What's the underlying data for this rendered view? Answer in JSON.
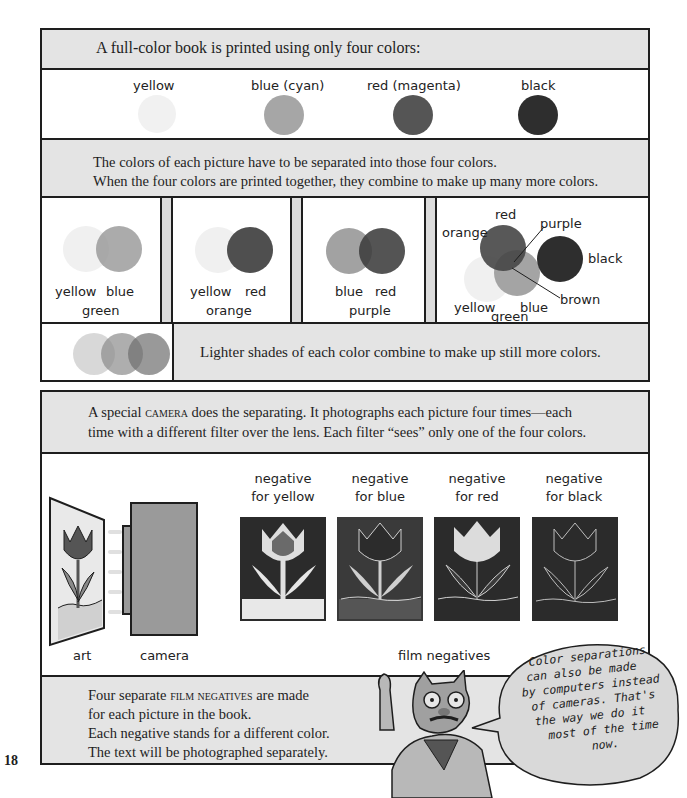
{
  "page_number": "18",
  "section1": {
    "header": "A full-color book is printed using only four colors:",
    "swatches": [
      {
        "label": "yellow",
        "color": "#f2f2f2"
      },
      {
        "label": "blue (cyan)",
        "color": "#a8a8a8"
      },
      {
        "label": "red (magenta)",
        "color": "#555555"
      },
      {
        "label": "black",
        "color": "#2e2e2e"
      }
    ],
    "explanation_line1": "The colors of each picture have to be separated into those four colors.",
    "explanation_line2": "When the four colors are printed together, they combine to make up many more colors.",
    "combinations": [
      {
        "left": "yellow",
        "right": "blue",
        "result": "green"
      },
      {
        "left": "yellow",
        "right": "red",
        "result": "orange"
      },
      {
        "left": "blue",
        "right": "red",
        "result": "purple"
      }
    ],
    "four_color_diagram": {
      "labels": {
        "red": "red",
        "purple": "purple",
        "orange": "orange",
        "black": "black",
        "brown": "brown",
        "yellow": "yellow",
        "green": "green",
        "blue": "blue"
      }
    },
    "lighter_shades_text": "Lighter shades of each color combine to make up still more colors."
  },
  "section2": {
    "header_pre": "A special ",
    "header_smallcaps": "camera",
    "header_post_line1": " does the separating. It photographs each picture four times—each",
    "header_line2": "time with a different filter over the lens. Each filter “sees” only one of the four colors.",
    "art_label": "art",
    "camera_label": "camera",
    "negatives": [
      {
        "line1": "negative",
        "line2": "for yellow"
      },
      {
        "line1": "negative",
        "line2": "for blue"
      },
      {
        "line1": "negative",
        "line2": "for red"
      },
      {
        "line1": "negative",
        "line2": "for black"
      }
    ],
    "film_negatives_label": "film negatives"
  },
  "section3": {
    "line1_pre": "Four separate ",
    "line1_smallcaps": "film negatives",
    "line1_post": " are made",
    "line2": "for each picture in the book.",
    "line3": "Each negative stands for a different color.",
    "line4": "The text will be photographed separately."
  },
  "speech_bubble": {
    "lines": [
      "Color separations",
      "can also be made",
      "by computers instead",
      "of cameras. That's",
      "the way we do it",
      "most of the time",
      "now."
    ]
  }
}
